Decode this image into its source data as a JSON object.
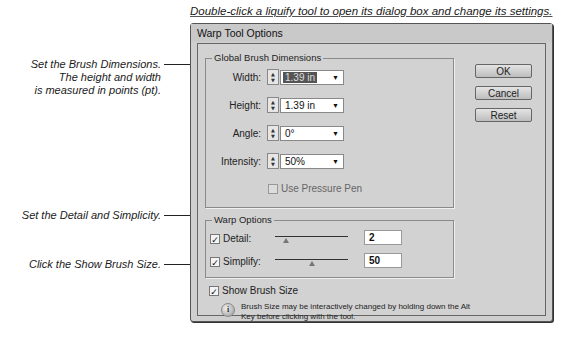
{
  "captions": {
    "top": "Double-click a liquify tool to open its dialog box and change its settings.",
    "brush_dimensions": [
      "Set the Brush Dimensions.",
      "The height and width",
      "is measured in points (pt)."
    ],
    "detail_simplicity": "Set the Detail and Simplicity.",
    "show_brush_size": "Click the Show Brush Size."
  },
  "dialog": {
    "title": "Warp Tool Options",
    "global_brush": {
      "label": "Global Brush Dimensions",
      "fields": [
        {
          "label": "Width:",
          "value": "1.39 in",
          "selected": true
        },
        {
          "label": "Height:",
          "value": "1.39 in",
          "selected": false
        },
        {
          "label": "Angle:",
          "value": "0°",
          "selected": false
        },
        {
          "label": "Intensity:",
          "value": "50%",
          "selected": false
        }
      ],
      "pressure_pen": {
        "label": "Use Pressure Pen",
        "checked": false,
        "enabled": false
      }
    },
    "warp_options": {
      "label": "Warp Options",
      "detail": {
        "label": "Detail:",
        "checked": true,
        "value": "2",
        "slider_pct": 18
      },
      "simplify": {
        "label": "Simplify:",
        "checked": true,
        "value": "50",
        "slider_pct": 48
      }
    },
    "show_brush_size": {
      "label": "Show Brush Size",
      "checked": true
    },
    "info_text": "Brush Size may be interactively changed by holding down the Alt Key before clicking with the tool.",
    "buttons": {
      "ok": "OK",
      "cancel": "Cancel",
      "reset": "Reset"
    }
  },
  "icons": {
    "check": "✓",
    "dropdown": "▼",
    "spin_up": "▲",
    "spin_down": "▼",
    "info": "i"
  }
}
